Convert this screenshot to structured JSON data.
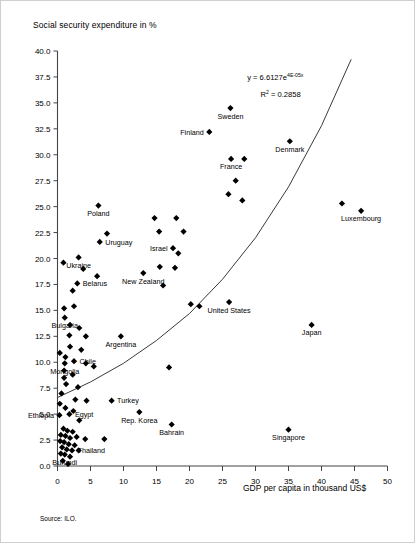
{
  "chart_data": {
    "type": "scatter",
    "title": "",
    "ylabel": "Social security expenditure in %",
    "xlabel": "GDP per capita in thousand US$",
    "source": "Source: ILO.",
    "xlim": [
      0,
      50
    ],
    "ylim": [
      0,
      40
    ],
    "grid": false,
    "legend": "none",
    "xticks": [
      "0",
      "5",
      "10",
      "15",
      "20",
      "25",
      "30",
      "35",
      "40",
      "45",
      "50"
    ],
    "xtick_values": [
      0,
      5,
      10,
      15,
      20,
      25,
      30,
      35,
      40,
      45,
      50
    ],
    "yticks": [
      "0.0",
      "2.5",
      "5.0",
      "7.5",
      "10.0",
      "12.5",
      "15.0",
      "17.5",
      "20.0",
      "22.5",
      "25.0",
      "27.5",
      "30.0",
      "32.5",
      "35.0",
      "37.5",
      "40.0"
    ],
    "ytick_values": [
      0,
      2.5,
      5,
      7.5,
      10,
      12.5,
      15,
      17.5,
      20,
      22.5,
      25,
      27.5,
      30,
      32.5,
      35,
      37.5,
      40
    ],
    "annotations": [
      {
        "id": "equation",
        "text": "y = 6.6127e",
        "sup": "4E-05x",
        "x": 33.0,
        "y": 37.2
      },
      {
        "id": "rsquared",
        "text": "R",
        "sup": "2",
        "text2": " = 0.2858",
        "x": 33.8,
        "y": 35.6
      }
    ],
    "trendline": {
      "type": "exponential",
      "equation": "y = 6.6127e^(4E-05x)",
      "r_squared": 0.2858,
      "a": 6.6127,
      "b": 4e-05,
      "path_points": [
        [
          0,
          6.6
        ],
        [
          5,
          8.1
        ],
        [
          10,
          9.9
        ],
        [
          15,
          12.1
        ],
        [
          20,
          14.7
        ],
        [
          25,
          18.0
        ],
        [
          30,
          22.0
        ],
        [
          35,
          26.9
        ],
        [
          40,
          32.8
        ],
        [
          44.5,
          39.2
        ]
      ]
    },
    "points": [
      {
        "x": 26.2,
        "y": 34.5,
        "label": "Sweden",
        "label_pos": "below"
      },
      {
        "x": 23.0,
        "y": 32.2,
        "label": "Finland",
        "label_pos": "left"
      },
      {
        "x": 35.2,
        "y": 31.3,
        "label": "Denmark",
        "label_pos": "below"
      },
      {
        "x": 26.3,
        "y": 29.6,
        "label": "France",
        "label_pos": "below"
      },
      {
        "x": 28.3,
        "y": 29.6,
        "label": ""
      },
      {
        "x": 27.0,
        "y": 27.5,
        "label": ""
      },
      {
        "x": 25.9,
        "y": 26.2,
        "label": ""
      },
      {
        "x": 28.0,
        "y": 25.6,
        "label": ""
      },
      {
        "x": 43.1,
        "y": 25.3,
        "label": ""
      },
      {
        "x": 46.0,
        "y": 24.6,
        "label": "Luxembourg",
        "label_pos": "below"
      },
      {
        "x": 6.2,
        "y": 25.1,
        "label": "Poland",
        "label_pos": "below"
      },
      {
        "x": 7.5,
        "y": 22.4,
        "label": ""
      },
      {
        "x": 6.4,
        "y": 21.6,
        "label": "Uruguay",
        "label_pos": "right"
      },
      {
        "x": 3.2,
        "y": 20.1,
        "label": "Ukraine",
        "label_pos": "below"
      },
      {
        "x": 3.9,
        "y": 19.0,
        "label": ""
      },
      {
        "x": 0.9,
        "y": 19.6,
        "label": ""
      },
      {
        "x": 3.0,
        "y": 17.6,
        "label": "Belarus",
        "label_pos": "right"
      },
      {
        "x": 2.3,
        "y": 16.9,
        "label": ""
      },
      {
        "x": 6.0,
        "y": 18.3,
        "label": ""
      },
      {
        "x": 15.4,
        "y": 22.6,
        "label": ""
      },
      {
        "x": 14.7,
        "y": 23.9,
        "label": ""
      },
      {
        "x": 18.0,
        "y": 23.9,
        "label": ""
      },
      {
        "x": 19.1,
        "y": 22.6,
        "label": ""
      },
      {
        "x": 17.5,
        "y": 21.0,
        "label": "Israel",
        "label_pos": "left"
      },
      {
        "x": 18.3,
        "y": 20.5,
        "label": ""
      },
      {
        "x": 17.8,
        "y": 19.1,
        "label": ""
      },
      {
        "x": 15.5,
        "y": 19.2,
        "label": ""
      },
      {
        "x": 13.0,
        "y": 18.6,
        "label": "New Zealand",
        "label_pos": "below"
      },
      {
        "x": 16.0,
        "y": 17.4,
        "label": ""
      },
      {
        "x": 20.2,
        "y": 15.6,
        "label": ""
      },
      {
        "x": 21.5,
        "y": 15.4,
        "label": ""
      },
      {
        "x": 26.0,
        "y": 15.8,
        "label": "United States",
        "label_pos": "below"
      },
      {
        "x": 2.5,
        "y": 15.4,
        "label": ""
      },
      {
        "x": 1.0,
        "y": 15.2,
        "label": ""
      },
      {
        "x": 1.1,
        "y": 14.3,
        "label": "Bulgaria",
        "label_pos": "below"
      },
      {
        "x": 1.9,
        "y": 13.6,
        "label": ""
      },
      {
        "x": 3.3,
        "y": 13.3,
        "label": ""
      },
      {
        "x": 1.8,
        "y": 12.6,
        "label": ""
      },
      {
        "x": 4.3,
        "y": 12.5,
        "label": ""
      },
      {
        "x": 9.6,
        "y": 12.5,
        "label": "Argentina",
        "label_pos": "below"
      },
      {
        "x": 1.9,
        "y": 11.5,
        "label": ""
      },
      {
        "x": 3.6,
        "y": 11.2,
        "label": ""
      },
      {
        "x": 1.2,
        "y": 10.5,
        "label": ""
      },
      {
        "x": 2.5,
        "y": 10.1,
        "label": "Chile",
        "label_pos": "right"
      },
      {
        "x": 1.1,
        "y": 9.9,
        "label": "Mongolia",
        "label_pos": "below"
      },
      {
        "x": 4.3,
        "y": 9.9,
        "label": ""
      },
      {
        "x": 5.5,
        "y": 9.6,
        "label": ""
      },
      {
        "x": 16.9,
        "y": 9.5,
        "label": ""
      },
      {
        "x": 38.5,
        "y": 13.6,
        "label": "Japan",
        "label_pos": "below"
      },
      {
        "x": 1.0,
        "y": 9.2,
        "label": ""
      },
      {
        "x": 2.3,
        "y": 8.8,
        "label": ""
      },
      {
        "x": 1.0,
        "y": 8.5,
        "label": ""
      },
      {
        "x": 1.3,
        "y": 7.9,
        "label": ""
      },
      {
        "x": 3.1,
        "y": 7.6,
        "label": ""
      },
      {
        "x": 0.6,
        "y": 7.0,
        "label": ""
      },
      {
        "x": 2.7,
        "y": 6.4,
        "label": ""
      },
      {
        "x": 4.4,
        "y": 6.3,
        "label": ""
      },
      {
        "x": 8.2,
        "y": 6.3,
        "label": "Turkey",
        "label_pos": "right"
      },
      {
        "x": 1.2,
        "y": 5.6,
        "label": ""
      },
      {
        "x": 2.4,
        "y": 5.3,
        "label": ""
      },
      {
        "x": 1.8,
        "y": 5.0,
        "label": "Egypt",
        "label_pos": "right"
      },
      {
        "x": 0.3,
        "y": 4.9,
        "label": "Ethiopia",
        "label_pos": "left"
      },
      {
        "x": 3.3,
        "y": 4.4,
        "label": ""
      },
      {
        "x": 12.4,
        "y": 5.2,
        "label": "Rep. Korea",
        "label_pos": "below"
      },
      {
        "x": 17.3,
        "y": 4.0,
        "label": "Bahrain",
        "label_pos": "below"
      },
      {
        "x": 35.0,
        "y": 3.5,
        "label": "Singapore",
        "label_pos": "below"
      },
      {
        "x": 0.9,
        "y": 3.6,
        "label": ""
      },
      {
        "x": 1.5,
        "y": 3.4,
        "label": ""
      },
      {
        "x": 2.3,
        "y": 3.3,
        "label": ""
      },
      {
        "x": 0.5,
        "y": 3.0,
        "label": ""
      },
      {
        "x": 1.2,
        "y": 2.9,
        "label": ""
      },
      {
        "x": 1.9,
        "y": 2.7,
        "label": ""
      },
      {
        "x": 2.9,
        "y": 2.8,
        "label": ""
      },
      {
        "x": 4.2,
        "y": 2.6,
        "label": ""
      },
      {
        "x": 7.1,
        "y": 2.6,
        "label": ""
      },
      {
        "x": 0.4,
        "y": 2.4,
        "label": ""
      },
      {
        "x": 1.0,
        "y": 2.3,
        "label": ""
      },
      {
        "x": 1.7,
        "y": 2.1,
        "label": ""
      },
      {
        "x": 2.6,
        "y": 2.0,
        "label": ""
      },
      {
        "x": 0.7,
        "y": 1.8,
        "label": ""
      },
      {
        "x": 1.4,
        "y": 1.6,
        "label": ""
      },
      {
        "x": 2.2,
        "y": 1.5,
        "label": "Thailand",
        "label_pos": "right"
      },
      {
        "x": 3.2,
        "y": 1.5,
        "label": ""
      },
      {
        "x": 0.5,
        "y": 1.2,
        "label": ""
      },
      {
        "x": 1.1,
        "y": 1.1,
        "label": "Burundi",
        "label_pos": "below"
      },
      {
        "x": 1.9,
        "y": 0.9,
        "label": ""
      },
      {
        "x": 0.8,
        "y": 0.5,
        "label": ""
      },
      {
        "x": 1.6,
        "y": 0.2,
        "label": ""
      },
      {
        "x": 0.35,
        "y": 6.0,
        "label": ""
      },
      {
        "x": 0.35,
        "y": 10.9,
        "label": ""
      }
    ]
  }
}
